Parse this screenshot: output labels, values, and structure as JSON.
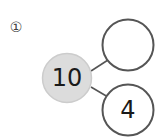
{
  "problem": {
    "number_label": "①"
  },
  "number_bond": {
    "whole": {
      "value": "10",
      "fill": "#dcdcdc",
      "stroke": "#cfcfcf"
    },
    "parts": [
      {
        "position": "top",
        "value": ""
      },
      {
        "position": "bottom",
        "value": "4"
      }
    ],
    "part_stroke": "#555555",
    "line_color": "#555555"
  }
}
